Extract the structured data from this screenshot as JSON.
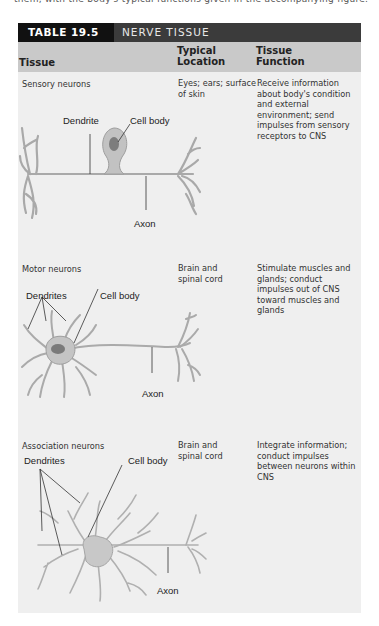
{
  "page": {
    "top_fragment": "them, with the body's typical functions given in the accompanying figure."
  },
  "table": {
    "number": "TABLE 19.5",
    "title": "NERVE TISSUE",
    "columns": {
      "tissue": "Tissue",
      "location": "Typical Location",
      "function": "Tissue Function"
    },
    "rows": [
      {
        "tissue": "Sensory neurons",
        "location": "Eyes; ears; surface of skin",
        "function": "Receive information about body's condition and external environment; send impulses from sensory receptors to CNS",
        "diagram_labels": {
          "dendrite": "Dendrite",
          "cell_body": "Cell body",
          "axon": "Axon"
        }
      },
      {
        "tissue": "Motor neurons",
        "location": "Brain and spinal cord",
        "function": "Stimulate muscles and glands; conduct impulses out of CNS toward muscles and glands",
        "diagram_labels": {
          "dendrites": "Dendrites",
          "cell_body": "Cell body",
          "axon": "Axon"
        }
      },
      {
        "tissue": "Association neurons",
        "location": "Brain and spinal cord",
        "function": "Integrate information; conduct impulses between neurons within CNS",
        "diagram_labels": {
          "dendrites": "Dendrites",
          "cell_body": "Cell body",
          "axon": "Axon"
        }
      }
    ]
  },
  "colors": {
    "title_number_bg": "#111111",
    "title_bar_bg": "#3b3b3b",
    "column_header_bg": "#c9c9c9",
    "body_bg": "#efefef",
    "neuron_fill": "#b5b5b5"
  }
}
